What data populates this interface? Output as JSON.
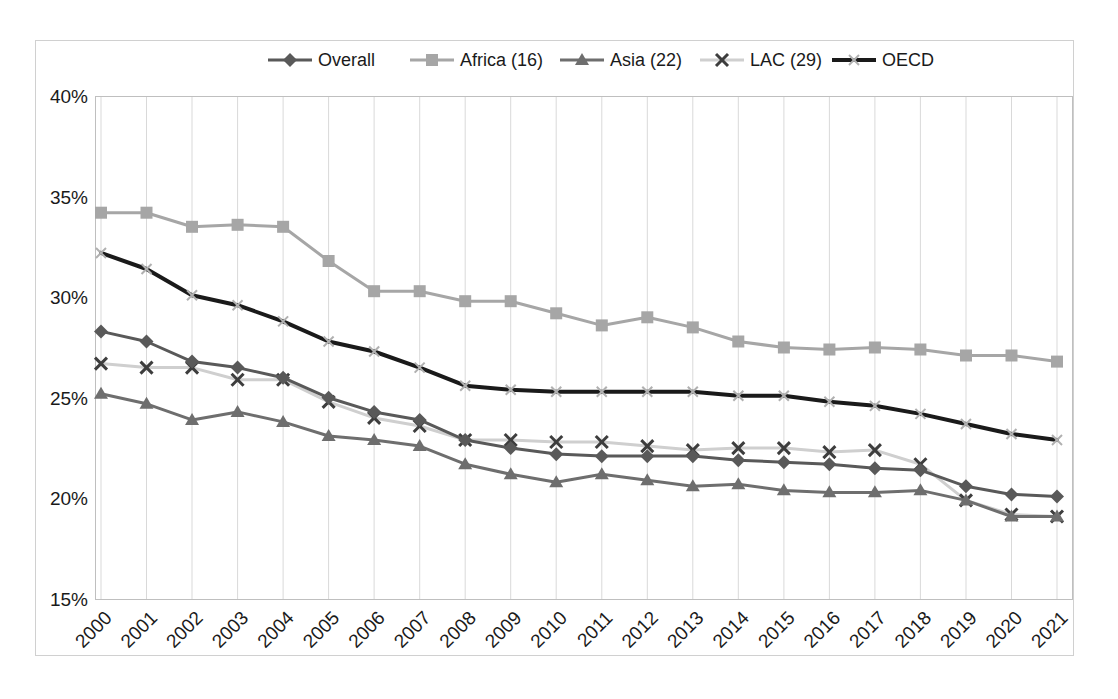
{
  "chart_data": {
    "type": "line",
    "title": "",
    "subtitle": "",
    "xlabel": "",
    "ylabel": "",
    "grid": "vertical",
    "legend_position": "top",
    "ylim": [
      15,
      40
    ],
    "ytick_values": [
      15,
      20,
      25,
      30,
      35,
      40
    ],
    "ytick_labels": [
      "15%",
      "20%",
      "25%",
      "30%",
      "35%",
      "40%"
    ],
    "categories": [
      "2000",
      "2001",
      "2002",
      "2003",
      "2004",
      "2005",
      "2006",
      "2007",
      "2008",
      "2009",
      "2010",
      "2011",
      "2012",
      "2013",
      "2014",
      "2015",
      "2016",
      "2017",
      "2018",
      "2019",
      "2020",
      "2021"
    ],
    "series": [
      {
        "name": "Overall",
        "label": "Overall",
        "color": "#595959",
        "marker": "diamond",
        "values": [
          28.3,
          27.8,
          26.8,
          26.5,
          26.0,
          25.0,
          24.3,
          23.9,
          22.9,
          22.5,
          22.2,
          22.1,
          22.1,
          22.1,
          21.9,
          21.8,
          21.7,
          21.5,
          21.4,
          20.6,
          20.2,
          20.1
        ]
      },
      {
        "name": "Africa (16)",
        "label": "Africa (16)",
        "color": "#a6a6a6",
        "marker": "square",
        "values": [
          34.2,
          34.2,
          33.5,
          33.6,
          33.5,
          31.8,
          30.3,
          30.3,
          29.8,
          29.8,
          29.2,
          28.6,
          29.0,
          28.5,
          27.8,
          27.5,
          27.4,
          27.5,
          27.4,
          27.1,
          27.1,
          26.8
        ]
      },
      {
        "name": "Asia (22)",
        "label": "Asia (22)",
        "color": "#6e6e6e",
        "marker": "triangle",
        "values": [
          25.2,
          24.7,
          23.9,
          24.3,
          23.8,
          23.1,
          22.9,
          22.6,
          21.7,
          21.2,
          20.8,
          21.2,
          20.9,
          20.6,
          20.7,
          20.4,
          20.3,
          20.3,
          20.4,
          19.9,
          19.1,
          19.1
        ]
      },
      {
        "name": "LAC (29)",
        "label": "LAC (29)",
        "color": "#cfcfcf",
        "marker": "cross",
        "values": [
          26.7,
          26.5,
          26.5,
          25.9,
          25.9,
          24.8,
          24.0,
          23.6,
          22.9,
          22.9,
          22.8,
          22.8,
          22.6,
          22.4,
          22.5,
          22.5,
          22.3,
          22.4,
          21.7,
          19.9,
          19.2,
          19.1
        ]
      },
      {
        "name": "OECD",
        "label": "OECD",
        "color": "#1a1a1a",
        "marker": "cross-light",
        "values": [
          32.2,
          31.4,
          30.1,
          29.6,
          28.8,
          27.8,
          27.3,
          26.5,
          25.6,
          25.4,
          25.3,
          25.3,
          25.3,
          25.3,
          25.1,
          25.1,
          24.8,
          24.6,
          24.2,
          23.7,
          23.2,
          22.9
        ]
      }
    ]
  },
  "legend": {
    "entries": [
      {
        "label": "Overall"
      },
      {
        "label": "Africa (16)"
      },
      {
        "label": "Asia (22)"
      },
      {
        "label": "LAC (29)"
      },
      {
        "label": "OECD"
      }
    ]
  },
  "colors": {
    "overall": "#595959",
    "africa": "#a6a6a6",
    "asia": "#6e6e6e",
    "lac": "#cfcfcf",
    "oecd": "#1a1a1a",
    "gridline": "#d9d9d9",
    "border": "#bfbfbf",
    "text": "#1a1a1a",
    "background": "#ffffff"
  }
}
